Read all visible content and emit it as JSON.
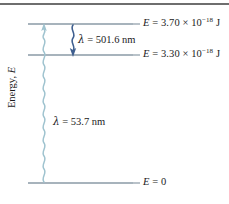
{
  "figure": {
    "axis_label_text": "Energy, ",
    "axis_label_symbol": "E",
    "background_color": "#ffffff",
    "rule_color": "#6e6e6e"
  },
  "levels": [
    {
      "name": "upper-level",
      "symbol": "E",
      "equals": " = ",
      "value": "3.70",
      "times": " × 10",
      "exponent": "−18",
      "unit": " J",
      "y": 24,
      "line_color": "#8a9aa6"
    },
    {
      "name": "middle-level",
      "symbol": "E",
      "equals": " = ",
      "value": "3.30",
      "times": " × 10",
      "exponent": "−18",
      "unit": " J",
      "y": 55,
      "line_color": "#8a9aa6"
    },
    {
      "name": "ground-level",
      "symbol": "E",
      "equals": " = ",
      "value": "0",
      "times": "",
      "exponent": "",
      "unit": "",
      "y": 183,
      "line_color": "#8a9aa6"
    }
  ],
  "transitions": [
    {
      "name": "emission-501",
      "lambda_symbol": "λ",
      "equals": " = ",
      "value": "501.6",
      "unit": " nm",
      "direction": "down",
      "color": "#3f5f8f",
      "label_x": 78,
      "label_y": 33
    },
    {
      "name": "absorption-537",
      "lambda_symbol": "λ",
      "equals": " = ",
      "value": "53.7",
      "unit": " nm",
      "direction": "up",
      "color": "#9fc3cf",
      "label_x": 53,
      "label_y": 115
    }
  ]
}
